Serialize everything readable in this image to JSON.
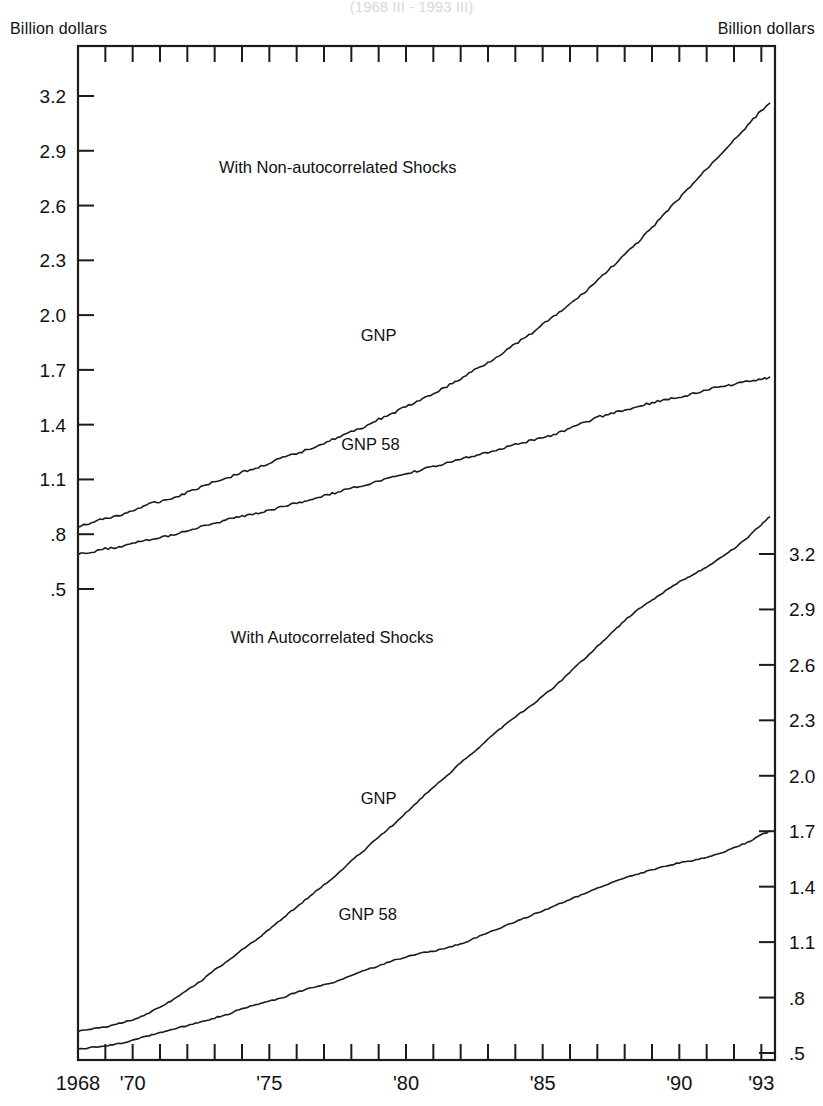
{
  "header": {
    "title_partial": "(1968 III - 1993 III)",
    "left_unit_label": "Billion dollars",
    "right_unit_label": "Billion dollars"
  },
  "chart_data": {
    "type": "line",
    "title": "",
    "xlabel": "",
    "ylabel": "Billion dollars",
    "grid": false,
    "legend_position": "inline-annotation",
    "x_axis": {
      "tick_labels": [
        "1968",
        "'70",
        "'75",
        "'80",
        "'85",
        "'90",
        "'93"
      ],
      "tick_values": [
        1968,
        1970,
        1975,
        1980,
        1985,
        1990,
        1993
      ],
      "minor_tick_interval": 1,
      "xlim": [
        1968,
        1993.5
      ]
    },
    "y_axis_left": {
      "tick_labels": [
        "3.2",
        "2.9",
        "2.6",
        "2.3",
        "2.0",
        "1.7",
        "1.4",
        "1.1",
        ".8",
        ".5"
      ],
      "tick_values": [
        3.2,
        2.9,
        2.6,
        2.3,
        2.0,
        1.7,
        1.4,
        1.1,
        0.8,
        0.5
      ],
      "ylim": [
        0.35,
        3.35
      ]
    },
    "y_axis_right": {
      "tick_labels": [
        "3.2",
        "2.9",
        "2.6",
        "2.3",
        "2.0",
        "1.7",
        "1.4",
        "1.1",
        ".8",
        ".5"
      ],
      "tick_values": [
        3.2,
        2.9,
        2.6,
        2.3,
        2.0,
        1.7,
        1.4,
        1.1,
        0.8,
        0.5
      ],
      "ylim": [
        0.35,
        3.35
      ]
    },
    "panels": [
      {
        "name": "upper",
        "annotation": "With Non-autocorrelated Shocks",
        "annotation_x": 1977.5,
        "annotation_y": 2.78,
        "axis": "left",
        "series": [
          {
            "name": "GNP",
            "label": "GNP",
            "label_x": 1979.0,
            "label_y": 1.86,
            "x": [
              1968,
              1968.5,
              1969,
              1969.5,
              1970,
              1970.5,
              1971,
              1971.5,
              1972,
              1972.5,
              1973,
              1973.5,
              1974,
              1974.5,
              1975,
              1975.5,
              1976,
              1976.5,
              1977,
              1977.5,
              1978,
              1978.5,
              1979,
              1979.5,
              1980,
              1980.5,
              1981,
              1981.5,
              1982,
              1982.5,
              1983,
              1983.5,
              1984,
              1984.5,
              1985,
              1985.5,
              1986,
              1986.5,
              1987,
              1987.5,
              1988,
              1988.5,
              1989,
              1989.5,
              1990,
              1990.5,
              1991,
              1991.5,
              1992,
              1992.5,
              1993,
              1993.3
            ],
            "y": [
              0.84,
              0.86,
              0.89,
              0.9,
              0.93,
              0.96,
              0.98,
              1.0,
              1.03,
              1.06,
              1.09,
              1.11,
              1.14,
              1.16,
              1.19,
              1.22,
              1.24,
              1.27,
              1.3,
              1.33,
              1.36,
              1.39,
              1.43,
              1.46,
              1.5,
              1.53,
              1.57,
              1.61,
              1.65,
              1.7,
              1.74,
              1.79,
              1.84,
              1.89,
              1.95,
              2.0,
              2.06,
              2.12,
              2.19,
              2.26,
              2.33,
              2.4,
              2.48,
              2.56,
              2.64,
              2.72,
              2.8,
              2.88,
              2.96,
              3.04,
              3.12,
              3.16
            ]
          },
          {
            "name": "GNP 58",
            "label": "GNP 58",
            "label_x": 1978.7,
            "label_y": 1.26,
            "x": [
              1968,
              1968.5,
              1969,
              1969.5,
              1970,
              1970.5,
              1971,
              1971.5,
              1972,
              1972.5,
              1973,
              1973.5,
              1974,
              1974.5,
              1975,
              1975.5,
              1976,
              1976.5,
              1977,
              1977.5,
              1978,
              1978.5,
              1979,
              1979.5,
              1980,
              1980.5,
              1981,
              1981.5,
              1982,
              1982.5,
              1983,
              1983.5,
              1984,
              1984.5,
              1985,
              1985.5,
              1986,
              1986.5,
              1987,
              1987.5,
              1988,
              1988.5,
              1989,
              1989.5,
              1990,
              1990.5,
              1991,
              1991.5,
              1992,
              1992.5,
              1993,
              1993.3
            ],
            "y": [
              0.69,
              0.7,
              0.72,
              0.73,
              0.75,
              0.77,
              0.78,
              0.8,
              0.82,
              0.84,
              0.86,
              0.88,
              0.9,
              0.91,
              0.93,
              0.95,
              0.97,
              0.99,
              1.01,
              1.03,
              1.05,
              1.07,
              1.09,
              1.11,
              1.13,
              1.15,
              1.17,
              1.19,
              1.21,
              1.23,
              1.25,
              1.27,
              1.29,
              1.31,
              1.33,
              1.35,
              1.38,
              1.41,
              1.44,
              1.46,
              1.48,
              1.5,
              1.52,
              1.54,
              1.55,
              1.57,
              1.59,
              1.61,
              1.62,
              1.64,
              1.65,
              1.66
            ]
          }
        ]
      },
      {
        "name": "lower",
        "annotation": "With Autocorrelated Shocks",
        "annotation_x": 1977.3,
        "annotation_y": 2.72,
        "axis": "right",
        "series": [
          {
            "name": "GNP",
            "label": "GNP",
            "label_x": 1979.0,
            "label_y": 1.85,
            "x": [
              1968,
              1968.5,
              1969,
              1969.5,
              1970,
              1970.5,
              1971,
              1971.5,
              1972,
              1972.5,
              1973,
              1973.5,
              1974,
              1974.5,
              1975,
              1975.5,
              1976,
              1976.5,
              1977,
              1977.5,
              1978,
              1978.5,
              1979,
              1979.5,
              1980,
              1980.5,
              1981,
              1981.5,
              1982,
              1982.5,
              1983,
              1983.5,
              1984,
              1984.5,
              1985,
              1985.5,
              1986,
              1986.5,
              1987,
              1987.5,
              1988,
              1988.5,
              1989,
              1989.5,
              1990,
              1990.5,
              1991,
              1991.5,
              1992,
              1992.5,
              1993,
              1993.3
            ],
            "y": [
              0.62,
              0.63,
              0.64,
              0.66,
              0.68,
              0.71,
              0.75,
              0.79,
              0.84,
              0.89,
              0.95,
              1.0,
              1.06,
              1.11,
              1.17,
              1.23,
              1.29,
              1.35,
              1.41,
              1.47,
              1.54,
              1.6,
              1.67,
              1.73,
              1.8,
              1.87,
              1.94,
              2.0,
              2.07,
              2.13,
              2.2,
              2.26,
              2.32,
              2.37,
              2.43,
              2.49,
              2.56,
              2.63,
              2.7,
              2.77,
              2.84,
              2.9,
              2.95,
              3.0,
              3.05,
              3.09,
              3.13,
              3.18,
              3.23,
              3.29,
              3.36,
              3.4
            ]
          },
          {
            "name": "GNP 58",
            "label": "GNP 58",
            "label_x": 1978.6,
            "label_y": 1.22,
            "x": [
              1968,
              1968.5,
              1969,
              1969.5,
              1970,
              1970.5,
              1971,
              1971.5,
              1972,
              1972.5,
              1973,
              1973.5,
              1974,
              1974.5,
              1975,
              1975.5,
              1976,
              1976.5,
              1977,
              1977.5,
              1978,
              1978.5,
              1979,
              1979.5,
              1980,
              1980.5,
              1981,
              1981.5,
              1982,
              1982.5,
              1983,
              1983.5,
              1984,
              1984.5,
              1985,
              1985.5,
              1986,
              1986.5,
              1987,
              1987.5,
              1988,
              1988.5,
              1989,
              1989.5,
              1990,
              1990.5,
              1991,
              1991.5,
              1992,
              1992.5,
              1993,
              1993.3
            ],
            "y": [
              0.52,
              0.53,
              0.54,
              0.55,
              0.57,
              0.59,
              0.61,
              0.63,
              0.65,
              0.67,
              0.69,
              0.71,
              0.74,
              0.76,
              0.78,
              0.8,
              0.83,
              0.85,
              0.87,
              0.89,
              0.92,
              0.95,
              0.97,
              1.0,
              1.02,
              1.04,
              1.05,
              1.07,
              1.09,
              1.12,
              1.15,
              1.18,
              1.21,
              1.24,
              1.27,
              1.3,
              1.33,
              1.36,
              1.39,
              1.42,
              1.45,
              1.47,
              1.49,
              1.51,
              1.53,
              1.54,
              1.56,
              1.58,
              1.61,
              1.64,
              1.68,
              1.7
            ]
          }
        ]
      }
    ]
  }
}
